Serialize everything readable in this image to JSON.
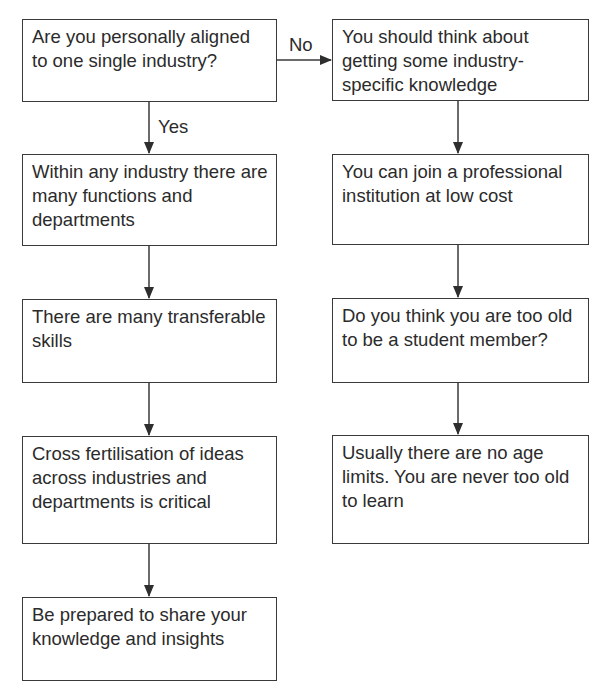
{
  "flowchart": {
    "left_column": [
      {
        "id": "L1",
        "text": "Are you personally aligned to one single industry?",
        "type": "decision"
      },
      {
        "id": "L2",
        "text": "Within any industry there are many functions and departments"
      },
      {
        "id": "L3",
        "text": "There are many transferable skills"
      },
      {
        "id": "L4",
        "text": "Cross fertilisation of ideas across industries and departments is critical"
      },
      {
        "id": "L5",
        "text": "Be prepared to share your knowledge and insights"
      }
    ],
    "right_column": [
      {
        "id": "R1",
        "text": "You should think about getting some industry-specific knowledge"
      },
      {
        "id": "R2",
        "text": "You can join a professional institution at low cost"
      },
      {
        "id": "R3",
        "text": "Do you think you are too old to be a student member?",
        "type": "decision"
      },
      {
        "id": "R4",
        "text": "Usually there are no age limits. You are never too old to learn"
      }
    ],
    "edge_labels": {
      "no": "No",
      "yes": "Yes"
    },
    "edges": [
      {
        "from": "L1",
        "to": "R1",
        "label": "No"
      },
      {
        "from": "L1",
        "to": "L2",
        "label": "Yes"
      },
      {
        "from": "L2",
        "to": "L3"
      },
      {
        "from": "L3",
        "to": "L4"
      },
      {
        "from": "L4",
        "to": "L5"
      },
      {
        "from": "R1",
        "to": "R2"
      },
      {
        "from": "R2",
        "to": "R3"
      },
      {
        "from": "R3",
        "to": "R4"
      }
    ],
    "colors": {
      "stroke": "#3a3a3a",
      "text": "#2b2b2b",
      "background": "#ffffff"
    }
  }
}
